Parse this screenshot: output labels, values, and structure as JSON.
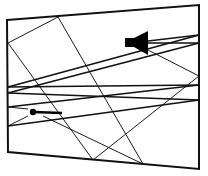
{
  "diagram": {
    "type": "acoustic-ray-reflection",
    "colors": {
      "stroke": "#111111",
      "background": "#ffffff"
    },
    "room": {
      "corners": [
        [
          7,
          20
        ],
        [
          199,
          5
        ],
        [
          199,
          169
        ],
        [
          8,
          152
        ]
      ]
    },
    "speaker": {
      "icon": "speaker-icon",
      "box": [
        125,
        38,
        9,
        9
      ],
      "cone": [
        [
          134,
          38
        ],
        [
          148,
          31
        ],
        [
          148,
          55
        ],
        [
          134,
          47
        ]
      ]
    },
    "microphone": {
      "icon": "microphone-icon",
      "head": [
        33,
        112
      ],
      "handle_end": [
        62,
        113
      ]
    },
    "rays": [
      {
        "x1": 8,
        "y1": 43,
        "x2": 58,
        "y2": 17,
        "w": "thin"
      },
      {
        "x1": 8,
        "y1": 43,
        "x2": 93,
        "y2": 160,
        "w": "thin"
      },
      {
        "x1": 58,
        "y1": 17,
        "x2": 143,
        "y2": 164,
        "w": "thin"
      },
      {
        "x1": 93,
        "y1": 160,
        "x2": 199,
        "y2": 76,
        "w": "thin"
      },
      {
        "x1": 148,
        "y1": 50,
        "x2": 199,
        "y2": 76,
        "w": "thin"
      },
      {
        "x1": 43,
        "y1": 116,
        "x2": 143,
        "y2": 164,
        "w": "thin"
      },
      {
        "x1": 8,
        "y1": 87,
        "x2": 199,
        "y2": 35,
        "w": "thick"
      },
      {
        "x1": 8,
        "y1": 93,
        "x2": 199,
        "y2": 43,
        "w": "thick"
      },
      {
        "x1": 148,
        "y1": 41,
        "x2": 199,
        "y2": 35,
        "w": "thick"
      },
      {
        "x1": 148,
        "y1": 43,
        "x2": 199,
        "y2": 43,
        "w": "thick"
      },
      {
        "x1": 8,
        "y1": 87,
        "x2": 199,
        "y2": 85,
        "w": "thick"
      },
      {
        "x1": 8,
        "y1": 93,
        "x2": 199,
        "y2": 100,
        "w": "thick"
      },
      {
        "x1": 8,
        "y1": 107,
        "x2": 199,
        "y2": 85,
        "w": "thick"
      },
      {
        "x1": 8,
        "y1": 126,
        "x2": 199,
        "y2": 100,
        "w": "thick"
      },
      {
        "x1": 8,
        "y1": 107,
        "x2": 28,
        "y2": 109,
        "w": "thin"
      },
      {
        "x1": 8,
        "y1": 126,
        "x2": 28,
        "y2": 116,
        "w": "thin"
      }
    ]
  }
}
